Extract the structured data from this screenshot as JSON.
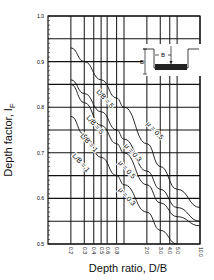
{
  "chart_data": {
    "type": "line",
    "title": "",
    "xlabel": "Depth ratio, D/B",
    "ylabel": "Depth factor, I_F",
    "ylabel_main": "Depth factor, I",
    "ylabel_sub": "F",
    "xscale": "log",
    "xlim": [
      0.1,
      10.0
    ],
    "ylim": [
      0.5,
      1.0
    ],
    "grid": true,
    "x_tick_labels": [
      "0.2",
      "0.3",
      "0.4",
      "0.5",
      "0.6",
      "0.8",
      "2.0",
      "3.0",
      "4.0",
      "5.0",
      "10.0"
    ],
    "x_ticks": [
      0.2,
      0.3,
      0.4,
      0.5,
      0.6,
      0.8,
      2.0,
      3.0,
      4.0,
      5.0,
      10.0
    ],
    "y_tick_labels": [
      "1.0",
      "0.9",
      "0.8",
      "0.7",
      "0.6",
      "0.5"
    ],
    "y_ticks": [
      1.0,
      0.9,
      0.8,
      0.7,
      0.6,
      0.5
    ],
    "series": [
      {
        "name": "L/B = 5, μ = 0.5",
        "label_left": "L/B = 5",
        "label_right": "μ = 0.5",
        "x": [
          0.2,
          0.3,
          0.5,
          0.8,
          1.0,
          2.0,
          3.0,
          5.0,
          10.0
        ],
        "values": [
          0.93,
          0.9,
          0.86,
          0.82,
          0.8,
          0.72,
          0.67,
          0.62,
          0.58
        ]
      },
      {
        "name": "L/B = 5, μ = 0.3",
        "label_left": "L/B = 5",
        "label_right": "μ = 0.3",
        "x": [
          0.2,
          0.3,
          0.5,
          0.8,
          1.0,
          2.0,
          3.0,
          5.0,
          10.0
        ],
        "values": [
          0.86,
          0.83,
          0.79,
          0.75,
          0.73,
          0.66,
          0.62,
          0.58,
          0.55
        ]
      },
      {
        "name": "L/B = 1, μ = 0.5",
        "label_left": "L/B = 1",
        "label_right": "μ = 0.5",
        "x": [
          0.2,
          0.3,
          0.5,
          0.8,
          1.0,
          2.0,
          3.0,
          5.0,
          10.0
        ],
        "values": [
          0.85,
          0.81,
          0.76,
          0.72,
          0.7,
          0.63,
          0.59,
          0.56,
          0.54
        ]
      },
      {
        "name": "L/B = 1, μ = 0.3",
        "label_left": "L/B = 1",
        "label_right": "μ = 0.3",
        "x": [
          0.2,
          0.3,
          0.5,
          0.8,
          1.0,
          2.0,
          3.0,
          5.0
        ],
        "values": [
          0.78,
          0.74,
          0.69,
          0.65,
          0.63,
          0.57,
          0.53,
          0.5
        ]
      }
    ],
    "inset": {
      "labels": [
        "B",
        "D"
      ],
      "description": "footing of width B embedded at depth D"
    }
  }
}
